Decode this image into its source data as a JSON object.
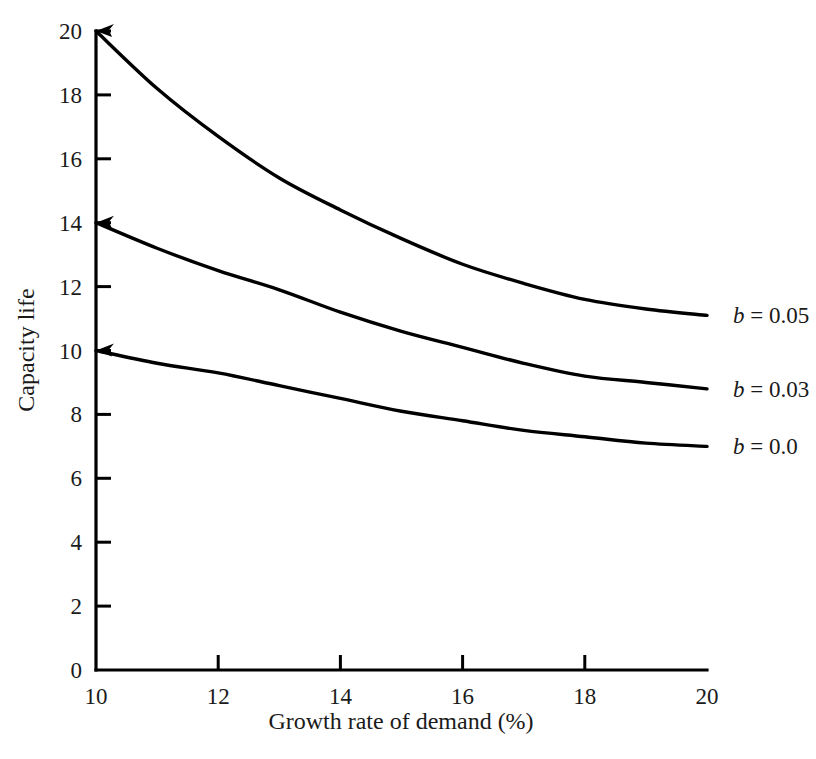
{
  "chart_data": {
    "type": "line",
    "title": "",
    "xlabel": "Growth rate of demand (%)",
    "ylabel": "Capacity life",
    "xlim": [
      10,
      20
    ],
    "ylim": [
      0,
      20
    ],
    "xticks": [
      10,
      12,
      14,
      16,
      18,
      20
    ],
    "yticks": [
      0,
      2,
      4,
      6,
      8,
      10,
      12,
      14,
      16,
      18,
      20
    ],
    "xtick_labels": [
      "10",
      "12",
      "14",
      "16",
      "18",
      "20"
    ],
    "ytick_labels": [
      "0",
      "2",
      "4",
      "6",
      "8",
      "10",
      "12",
      "14",
      "16",
      "18",
      "20"
    ],
    "grid": false,
    "legend_position": "right-of-curve-ends",
    "line_color": "#000000",
    "background_color": "#ffffff",
    "x": [
      10,
      11,
      12,
      13,
      14,
      15,
      16,
      17,
      18,
      19,
      20
    ],
    "series": [
      {
        "name": "b = 0.05",
        "label_math": "b = 0.05",
        "label_variable": "b",
        "label_rest": " = 0.05",
        "values": [
          20.0,
          18.2,
          16.7,
          15.4,
          14.4,
          13.5,
          12.7,
          12.1,
          11.6,
          11.3,
          11.1
        ]
      },
      {
        "name": "b = 0.03",
        "label_math": "b = 0.03",
        "label_variable": "b",
        "label_rest": " = 0.03",
        "values": [
          14.0,
          13.2,
          12.5,
          11.9,
          11.2,
          10.6,
          10.1,
          9.6,
          9.2,
          9.0,
          8.8
        ]
      },
      {
        "name": "b = 0.0",
        "label_math": "b = 0.0",
        "label_variable": "b",
        "label_rest": " = 0.0",
        "values": [
          10.0,
          9.6,
          9.3,
          8.9,
          8.5,
          8.1,
          7.8,
          7.5,
          7.3,
          7.1,
          7.0
        ]
      }
    ]
  },
  "labels": {
    "xlabel": "Growth rate of demand (%)",
    "ylabel": "Capacity life"
  }
}
